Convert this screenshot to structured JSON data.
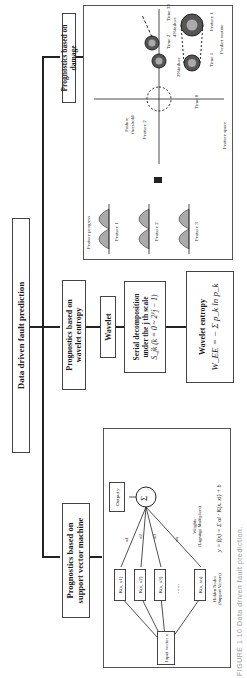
{
  "title": "Data driven fault prediction",
  "caption": "FIGURE 1.10 Data driven fault prediction.",
  "branches": {
    "svm": {
      "label_line1": "Prognostics based on",
      "label_line2": "support vector machine",
      "input": "Input vector x",
      "kernels": [
        "K(x, x1)",
        "K(x, x2)",
        "K(x, x3)",
        "K(x, xn)"
      ],
      "ellipsis": "......",
      "weights": [
        "α1",
        "α2",
        "α3",
        "αn"
      ],
      "sum": "Σ",
      "output": "Output y",
      "hidden_nodes_line1": "Hidden Nodes",
      "hidden_nodes_line2": "(Support Vectors)",
      "weights_line1": "Weights",
      "weights_line2": "(Lagrange Multipliers)",
      "formula": "y = f(x) = Σ αi · K(x, xi) + b"
    },
    "wavelet": {
      "label_line1": "Prognostics based on",
      "label_line2": "wavelet entropy",
      "wavelet_box": "Wavelet",
      "serial_line1": "Serial decomposition",
      "serial_line2": "under the  j th scale",
      "serial_line3": "S_jk (k = 0 ~ 2^j − 1)",
      "entropy_title": "Wavelet entropy",
      "entropy_formula": "W_EE = − Σ p_k ln p_k"
    },
    "damage": {
      "label": "Prognostics based on damage",
      "feature_progress": "Feature progress",
      "features": [
        "Feature 1",
        "Feature 2",
        "Feature 3"
      ],
      "feature_space": "Feature space",
      "axis_feature1": "Feature 1",
      "axis_feature2": "Feature 2",
      "failure_threshold_line1": "Failure",
      "failure_threshold_line2": "threshold",
      "times": [
        "Time 0",
        "Time 1",
        "Time 2",
        "Time 33"
      ],
      "failure_2": "2%failure",
      "failure_4": "4%failure",
      "predict_routine": "Predict routine"
    }
  }
}
